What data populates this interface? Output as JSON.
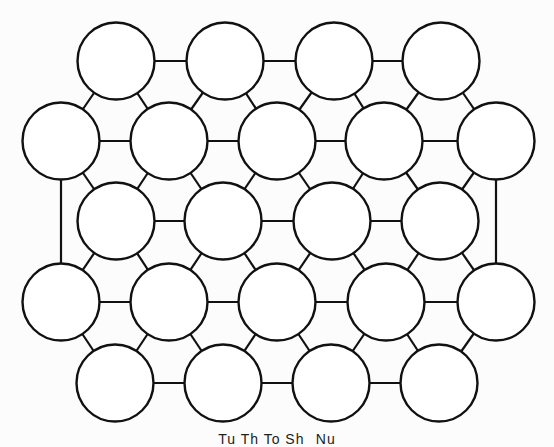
{
  "diagram": {
    "type": "circle-packing-lattice",
    "radius": 38.5,
    "stroke_color": "#111111",
    "fill_color": "#ffffff",
    "background_color": "#fcfcfc",
    "rows": [
      {
        "y": 61,
        "x": [
          116,
          225,
          334,
          441
        ]
      },
      {
        "y": 141,
        "x": [
          61,
          169,
          277,
          384,
          496
        ]
      },
      {
        "y": 221,
        "x": [
          116,
          223,
          332,
          440
        ]
      },
      {
        "y": 302,
        "x": [
          61,
          169,
          277,
          386,
          496
        ]
      },
      {
        "y": 383,
        "x": [
          115,
          223,
          331,
          439
        ]
      }
    ],
    "extra_edges": [
      {
        "from": [
          1,
          0
        ],
        "to": [
          3,
          0
        ],
        "label": "left-vertical-edge"
      },
      {
        "from": [
          1,
          4
        ],
        "to": [
          3,
          4
        ],
        "label": "right-vertical-edge"
      }
    ]
  },
  "caption": {
    "text": "Tu Th To Sh   Nu",
    "clipped": true
  }
}
